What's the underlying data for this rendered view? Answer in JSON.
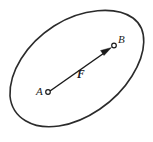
{
  "figure": {
    "name": "force-vector-on-rigid-body",
    "background_color": "#ffffff",
    "stroke_color": "#2b2b2b",
    "vector_color": "#1a1a1a",
    "width": 153,
    "height": 142,
    "labels": {
      "point_a": "A",
      "point_b": "B",
      "vector_f": "F"
    },
    "points": [
      {
        "id": "A",
        "label": "A",
        "x": 48,
        "y": 92,
        "marker": "open-circle"
      },
      {
        "id": "B",
        "label": "B",
        "x": 114,
        "y": 46,
        "marker": "open-circle"
      }
    ],
    "vector": {
      "label": "F",
      "from": "A",
      "to": "B",
      "start_x": 50,
      "start_y": 91,
      "end_x": 111,
      "end_y": 48,
      "style": "solid-arrow",
      "head": "filled-triangle"
    },
    "outline": {
      "shape": "closed-blob",
      "description": "rotated oval rigid body outline",
      "path": "M 10 96 C 9 72 26 44 54 26 C 82 8 116 6 133 18 C 148 29 147 52 132 76 C 116 102 86 122 59 126 C 33 130 12 118 10 96 Z"
    }
  }
}
